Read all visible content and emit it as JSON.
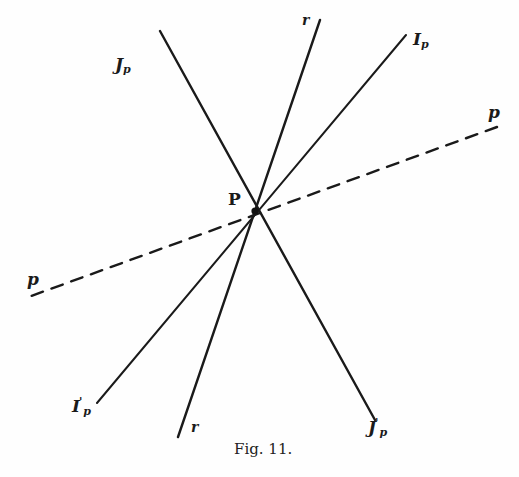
{
  "figure": {
    "caption": "Fig. 11.",
    "point": {
      "label": "P",
      "x": 255,
      "y": 211
    },
    "lines": [
      {
        "id": "J_p",
        "style": "solid",
        "x1": 160,
        "y1": 31,
        "x2": 375,
        "y2": 420,
        "label_start": "J",
        "label_start_sub": "p",
        "label_end": "J",
        "label_end_sub": "p",
        "label_end_prime": "'"
      },
      {
        "id": "r",
        "style": "solid",
        "x1": 320,
        "y1": 20,
        "x2": 178,
        "y2": 437,
        "label_start": "r",
        "label_end": "r"
      },
      {
        "id": "I_p",
        "style": "solid",
        "x1": 406,
        "y1": 35,
        "x2": 97,
        "y2": 403,
        "label_start": "I",
        "label_start_sub": "p",
        "label_end": "I",
        "label_end_sub": "p",
        "label_end_prime": "'"
      },
      {
        "id": "p",
        "style": "dashed",
        "x1": 497,
        "y1": 127,
        "x2": 31,
        "y2": 296,
        "label_start": "p",
        "label_end": "p"
      }
    ],
    "colors": {
      "ink": "#1a1a1a",
      "background": "#fefefe"
    }
  }
}
